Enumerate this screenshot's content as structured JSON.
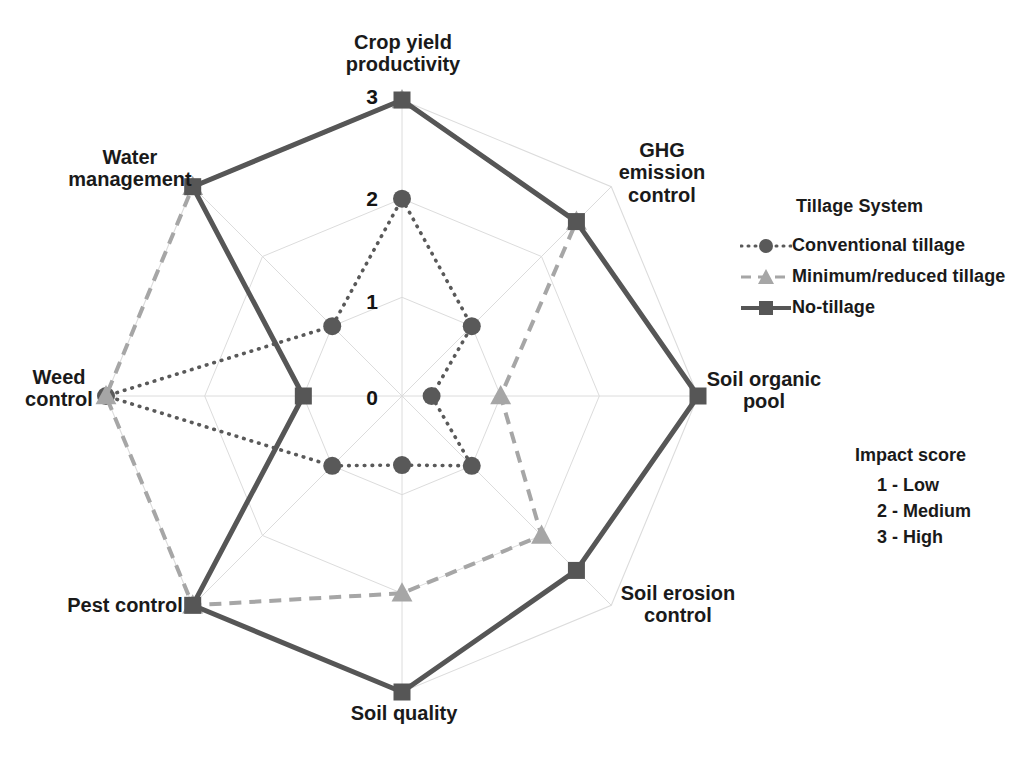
{
  "chart_data": {
    "type": "radar",
    "title": "",
    "categories": [
      "Crop yield\nproductivity",
      "GHG\nemission\ncontrol",
      "Soil organic\npool",
      "Soil erosion\ncontrol",
      "Soil quality",
      "Pest control",
      "Weed\ncontrol",
      "Water\nmanagement"
    ],
    "categories_plain": [
      "Crop yield productivity",
      "GHG emission control",
      "Soil organic pool",
      "Soil erosion control",
      "Soil quality",
      "Pest control",
      "Weed control",
      "Water management"
    ],
    "series": [
      {
        "name": "Conventional tillage",
        "values": [
          2,
          1,
          0.3,
          1,
          0.7,
          1,
          3,
          1
        ],
        "color": "#595959",
        "line_style": "dotted",
        "marker": "circle"
      },
      {
        "name": "Minimum/reduced tillage",
        "values": [
          3,
          2.5,
          1,
          2,
          2,
          3,
          3,
          3
        ],
        "color": "#a6a6a6",
        "line_style": "dashed",
        "marker": "triangle"
      },
      {
        "name": "No-tillage",
        "values": [
          3,
          2.5,
          3,
          2.5,
          3,
          3,
          1,
          3
        ],
        "color": "#565656",
        "line_style": "solid",
        "marker": "square"
      }
    ],
    "radial_ticks": [
      "0",
      "1",
      "2",
      "3"
    ],
    "radial_range": [
      0,
      3
    ],
    "grid": true,
    "legend_position": "right",
    "xlabel": "",
    "ylabel": ""
  },
  "legend": {
    "title": "Tillage System",
    "items": [
      {
        "label": "Conventional tillage"
      },
      {
        "label": "Minimum/reduced tillage"
      },
      {
        "label": "No-tillage"
      }
    ]
  },
  "score_legend": {
    "title": "Impact score",
    "items": [
      "1 - Low",
      "2 - Medium",
      "3 - High"
    ]
  }
}
